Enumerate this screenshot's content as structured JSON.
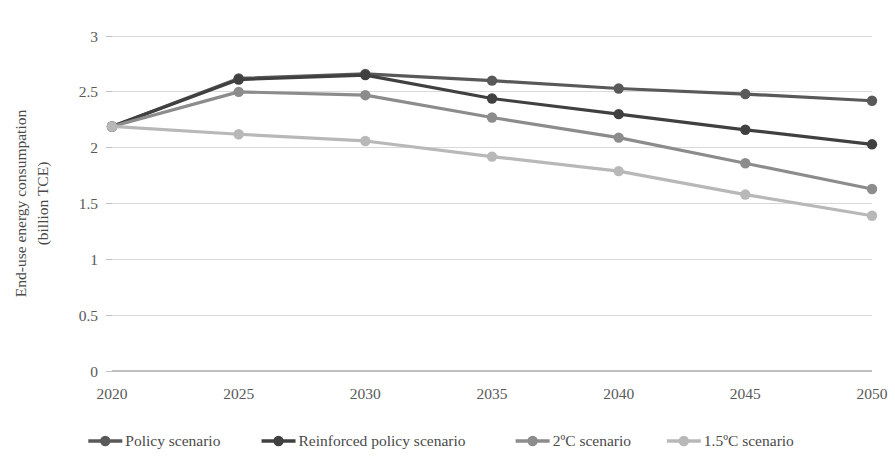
{
  "chart_data": {
    "type": "line",
    "title": "",
    "xlabel": "",
    "ylabel": "End-use energy consumpation\n(billion TCE)",
    "ylabel_line1": "End-use energy consumpation",
    "ylabel_line2": "(billion TCE)",
    "categories": [
      "2020",
      "2025",
      "2030",
      "2035",
      "2040",
      "2045",
      "2050"
    ],
    "x": [
      2020,
      2025,
      2030,
      2035,
      2040,
      2045,
      2050
    ],
    "ylim": [
      0,
      3
    ],
    "yticks": [
      0,
      0.5,
      1,
      1.5,
      2,
      2.5,
      3
    ],
    "ytick_labels": [
      "0",
      "0.5",
      "1",
      "1.5",
      "2",
      "2.5",
      "3"
    ],
    "grid": true,
    "grid_axis": "y",
    "legend_position": "bottom",
    "series": [
      {
        "name": "Policy scenario",
        "color": "#595959",
        "values": [
          2.19,
          2.62,
          2.66,
          2.6,
          2.53,
          2.48,
          2.42
        ]
      },
      {
        "name": "Reinforced policy scenario",
        "color": "#404040",
        "values": [
          2.19,
          2.61,
          2.65,
          2.44,
          2.3,
          2.16,
          2.03
        ]
      },
      {
        "name": "2ºC scenario",
        "color": "#8c8c8c",
        "values": [
          2.19,
          2.5,
          2.47,
          2.27,
          2.09,
          1.86,
          1.63
        ]
      },
      {
        "name": "1.5ºC scenario",
        "color": "#b8b8b8",
        "values": [
          2.19,
          2.12,
          2.06,
          1.92,
          1.79,
          1.58,
          1.39
        ]
      }
    ]
  },
  "legend": {
    "items": [
      {
        "label": "Policy scenario",
        "color": "#595959"
      },
      {
        "label": "Reinforced policy scenario",
        "color": "#404040"
      },
      {
        "label": "2ºC scenario",
        "color": "#8c8c8c"
      },
      {
        "label": "1.5ºC scenario",
        "color": "#b8b8b8"
      }
    ]
  }
}
